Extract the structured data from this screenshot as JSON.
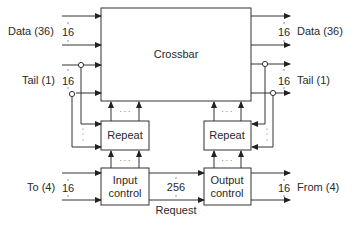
{
  "diagram": {
    "blocks": {
      "crossbar": "Crossbar",
      "repeat_left": "Repeat",
      "repeat_right": "Repeat",
      "input_control_l1": "Input",
      "input_control_l2": "control",
      "output_control_l1": "Output",
      "output_control_l2": "control"
    },
    "left_labels": {
      "data": "Data (36)",
      "data_count": "16",
      "tail": "Tail (1)",
      "tail_count": "16",
      "to": "To (4)",
      "to_count": "16"
    },
    "right_labels": {
      "data": "Data (36)",
      "data_count": "16",
      "tail": "Tail (1)",
      "tail_count": "16",
      "from": "From (4)",
      "from_count": "16"
    },
    "middle": {
      "bus_count": "256",
      "request": "Request",
      "ellipsis": "· · ·"
    }
  }
}
